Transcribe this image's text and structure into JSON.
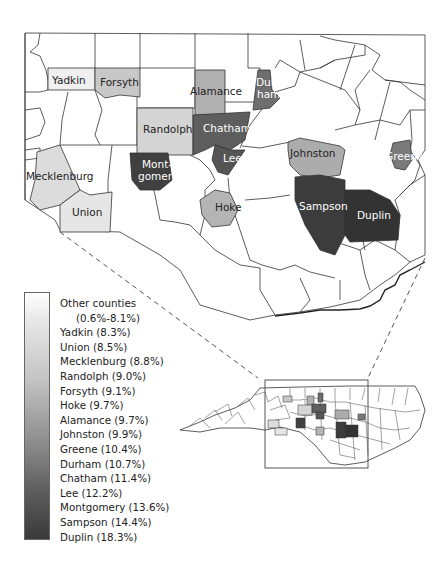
{
  "map": {
    "title": "North Carolina counties (inset)",
    "colors": {
      "other": "#ffffff",
      "yadkin": "#f0f0f0",
      "union": "#e6e6e6",
      "mecklenburg": "#dcdcdc",
      "randolph": "#d4d4d4",
      "forsyth": "#c8c8c8",
      "hoke": "#b4b4b4",
      "alamance": "#b0b0b0",
      "johnston": "#acacac",
      "greene": "#7a7a7a",
      "durham": "#6e6e6e",
      "chatham": "#5e5e5e",
      "lee": "#555555",
      "montgomery": "#404040",
      "sampson": "#3c3c3c",
      "duplin": "#333333"
    },
    "county_labels": {
      "yadkin": "Yadkin",
      "forsyth": "Forsyth",
      "alamance": "Alamance",
      "durham_1": "Dur-",
      "durham_2": "ham",
      "randolph": "Randolph",
      "chatham": "Chatham",
      "johnston": "Johnston",
      "greene": "Greene",
      "lee": "Lee",
      "mecklenburg": "Mecklenburg",
      "montgomery_1": "Mont-",
      "montgomery_2": "gomery",
      "hoke": "Hoke",
      "sampson": "Sampson",
      "duplin": "Duplin",
      "union": "Union"
    }
  },
  "legend": {
    "items": [
      {
        "label": "Other counties"
      },
      {
        "label": "(0.6%-8.1%)"
      },
      {
        "label": "Yadkin (8.3%)"
      },
      {
        "label": "Union (8.5%)"
      },
      {
        "label": "Mecklenburg (8.8%)"
      },
      {
        "label": "Randolph (9.0%)"
      },
      {
        "label": "Forsyth (9.1%)"
      },
      {
        "label": "Hoke (9.7%)"
      },
      {
        "label": "Alamance (9.7%)"
      },
      {
        "label": "Johnston (9.9%)"
      },
      {
        "label": "Greene (10.4%)"
      },
      {
        "label": "Durham (10.7%)"
      },
      {
        "label": "Chatham (11.4%)"
      },
      {
        "label": "Lee (12.2%)"
      },
      {
        "label": "Montgomery (13.6%)"
      },
      {
        "label": "Sampson (14.4%)"
      },
      {
        "label": "Duplin (18.3%)"
      }
    ]
  }
}
